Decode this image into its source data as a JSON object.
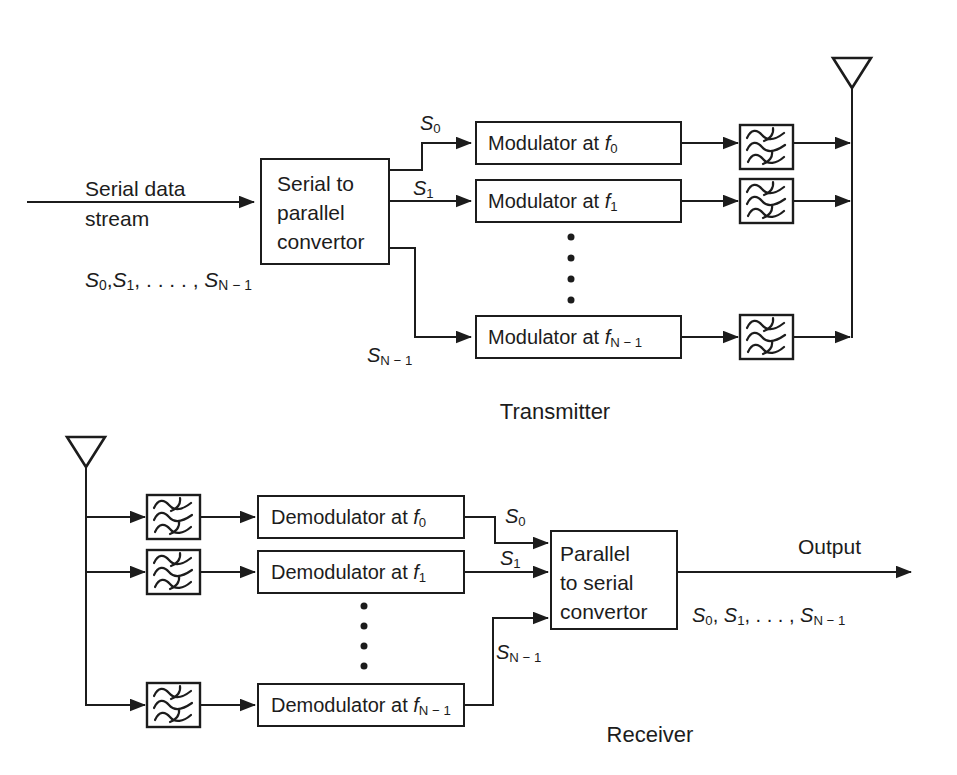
{
  "colors": {
    "ink": "#1c1c1c",
    "background": "#ffffff"
  },
  "transmitter": {
    "caption": "Transmitter",
    "input_label_line1": "Serial data",
    "input_label_line2": "stream",
    "s2p_lines": [
      "Serial to",
      "parallel",
      "convertor"
    ],
    "stream_list": {
      "s0_base": "S",
      "s0_sub": "0",
      "sep1": ",",
      "s1_base": "S",
      "s1_sub": "1",
      "sep2": ", . . . . , ",
      "sn_base": "S",
      "sn_sub": "N − 1"
    },
    "signals": {
      "s0": {
        "base": "S",
        "sub": "0"
      },
      "s1": {
        "base": "S",
        "sub": "1"
      },
      "sn": {
        "base": "S",
        "sub": "N − 1"
      }
    },
    "modulators": [
      {
        "prefix": "Modulator at ",
        "freq_base": "f",
        "freq_sub": "0"
      },
      {
        "prefix": "Modulator at ",
        "freq_base": "f",
        "freq_sub": "1"
      },
      {
        "prefix": "Modulator at ",
        "freq_base": "f",
        "freq_sub": "N − 1"
      }
    ]
  },
  "receiver": {
    "caption": "Receiver",
    "output_label": "Output",
    "p2s_lines": [
      "Parallel",
      "to serial",
      "convertor"
    ],
    "stream_list": {
      "s0_base": "S",
      "s0_sub": "0",
      "sep1": ", ",
      "s1_base": "S",
      "s1_sub": "1",
      "sep2": ", . . . , ",
      "sn_base": "S",
      "sn_sub": "N − 1"
    },
    "signals": {
      "s0": {
        "base": "S",
        "sub": "0"
      },
      "s1": {
        "base": "S",
        "sub": "1"
      },
      "sn": {
        "base": "S",
        "sub": "N − 1"
      }
    },
    "demodulators": [
      {
        "prefix": "Demodulator at ",
        "freq_base": "f",
        "freq_sub": "0"
      },
      {
        "prefix": "Demodulator at ",
        "freq_base": "f",
        "freq_sub": "1"
      },
      {
        "prefix": "Demodulator at ",
        "freq_base": "f",
        "freq_sub": "N − 1"
      }
    ]
  }
}
